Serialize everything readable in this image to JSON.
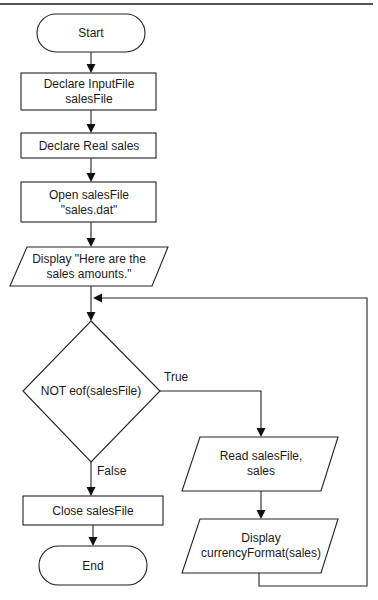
{
  "diagram": {
    "type": "flowchart",
    "nodes": {
      "start": {
        "shape": "terminal",
        "lines": [
          "Start"
        ]
      },
      "declare_file": {
        "shape": "process",
        "lines": [
          "Declare InputFile",
          "salesFile"
        ]
      },
      "declare_sales": {
        "shape": "process",
        "lines": [
          "Declare Real sales"
        ]
      },
      "open_file": {
        "shape": "process",
        "lines": [
          "Open salesFile",
          "\"sales.dat\""
        ]
      },
      "display_heading": {
        "shape": "input-output",
        "lines": [
          "Display \"Here are the",
          "sales amounts.\""
        ]
      },
      "decision": {
        "shape": "decision",
        "lines": [
          "NOT eof(salesFile)"
        ]
      },
      "read_sales": {
        "shape": "input-output",
        "lines": [
          "Read salesFile,",
          "sales"
        ]
      },
      "display_sales": {
        "shape": "input-output",
        "lines": [
          "Display",
          "currencyFormat(sales)"
        ]
      },
      "close_file": {
        "shape": "process",
        "lines": [
          "Close salesFile"
        ]
      },
      "end": {
        "shape": "terminal",
        "lines": [
          "End"
        ]
      }
    },
    "edges": {
      "true_label": "True",
      "false_label": "False"
    },
    "flow": [
      {
        "from": "start",
        "to": "declare_file"
      },
      {
        "from": "declare_file",
        "to": "declare_sales"
      },
      {
        "from": "declare_sales",
        "to": "open_file"
      },
      {
        "from": "open_file",
        "to": "display_heading"
      },
      {
        "from": "display_heading",
        "to": "decision"
      },
      {
        "from": "decision",
        "to": "read_sales",
        "label": "True"
      },
      {
        "from": "read_sales",
        "to": "display_sales"
      },
      {
        "from": "display_sales",
        "to": "decision",
        "loop": true
      },
      {
        "from": "decision",
        "to": "close_file",
        "label": "False"
      },
      {
        "from": "close_file",
        "to": "end"
      }
    ]
  },
  "colors": {
    "stroke": "#222222",
    "background": "#ffffff",
    "text": "#1a1a1a"
  }
}
